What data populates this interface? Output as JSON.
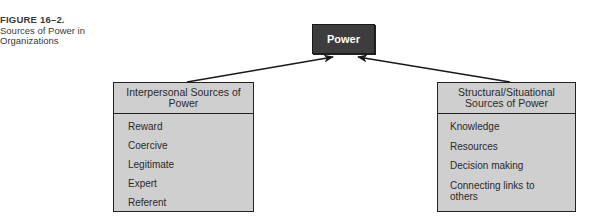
{
  "caption": {
    "figure_label": "FIGURE 16–2.",
    "title": "Sources of Power in Organizations"
  },
  "center_node": {
    "label": "Power",
    "fill": "#3d3d3d",
    "text_color": "#ffffff"
  },
  "left_box": {
    "header": "Interpersonal Sources of Power",
    "items": [
      "Reward",
      "Coercive",
      "Legitimate",
      "Expert",
      "Referent"
    ],
    "fill": "#cfcfcf"
  },
  "right_box": {
    "header": "Structural/Situational Sources of Power",
    "items": [
      "Knowledge",
      "Resources",
      "Decision making",
      "Connecting links to others"
    ],
    "fill": "#cfcfcf"
  },
  "edges": [
    {
      "from": "left_box",
      "to": "center_node"
    },
    {
      "from": "right_box",
      "to": "center_node"
    }
  ]
}
